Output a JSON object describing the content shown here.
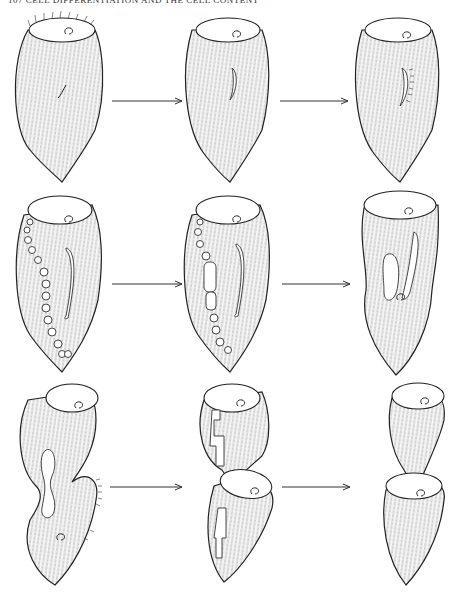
{
  "page": {
    "header": "107 CELL DIFFERENTIATION AND THE CELL CONTENT"
  },
  "figure": {
    "rows": [
      {
        "row": 1,
        "panels": [
          "intact cell with oral membranelles",
          "primordium appearing",
          "primordium with cilia"
        ],
        "arrows": 2
      },
      {
        "row": 2,
        "panels": [
          "macronucleus beaded, primordium lengthening",
          "macronucleus condensing",
          "new oral primordium forming"
        ],
        "arrows": 2
      },
      {
        "row": 3,
        "panels": [
          "constriction forming, nucleus elongated",
          "two daughter cells separating",
          "daughter cells separated"
        ],
        "arrows": 2
      }
    ]
  }
}
